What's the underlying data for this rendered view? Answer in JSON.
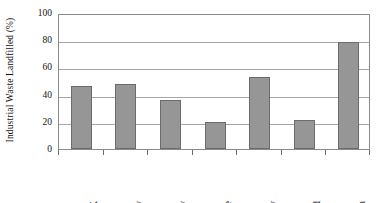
{
  "chart_data": {
    "type": "bar",
    "title": "",
    "subtitle": "",
    "xlabel": "",
    "ylabel": "Industrial Waste Landfilled (%)",
    "categories": [
      "UK",
      "Norway",
      "Germany",
      "France",
      "Italy",
      "Finland",
      "Romania"
    ],
    "values": [
      46,
      48,
      36,
      20,
      53,
      21,
      79
    ],
    "series": [
      {
        "name": "Industrial Waste Landfilled",
        "values": [
          46,
          48,
          36,
          20,
          53,
          21,
          79
        ]
      }
    ],
    "ylim": [
      0,
      100
    ],
    "ytick_labels": [
      "0",
      "20",
      "40",
      "60",
      "80",
      "100"
    ],
    "ytick_values": [
      0,
      20,
      40,
      60,
      80,
      100
    ],
    "grid": "horizontal",
    "legend": "none",
    "bar_color": "#969696",
    "bar_border_color": "#6b6b6b",
    "gridline_color": "#a6a6a6",
    "frame_color": "#8a8a8a",
    "text_color": "#141414",
    "background_color": "#ffffff",
    "annotations": []
  }
}
